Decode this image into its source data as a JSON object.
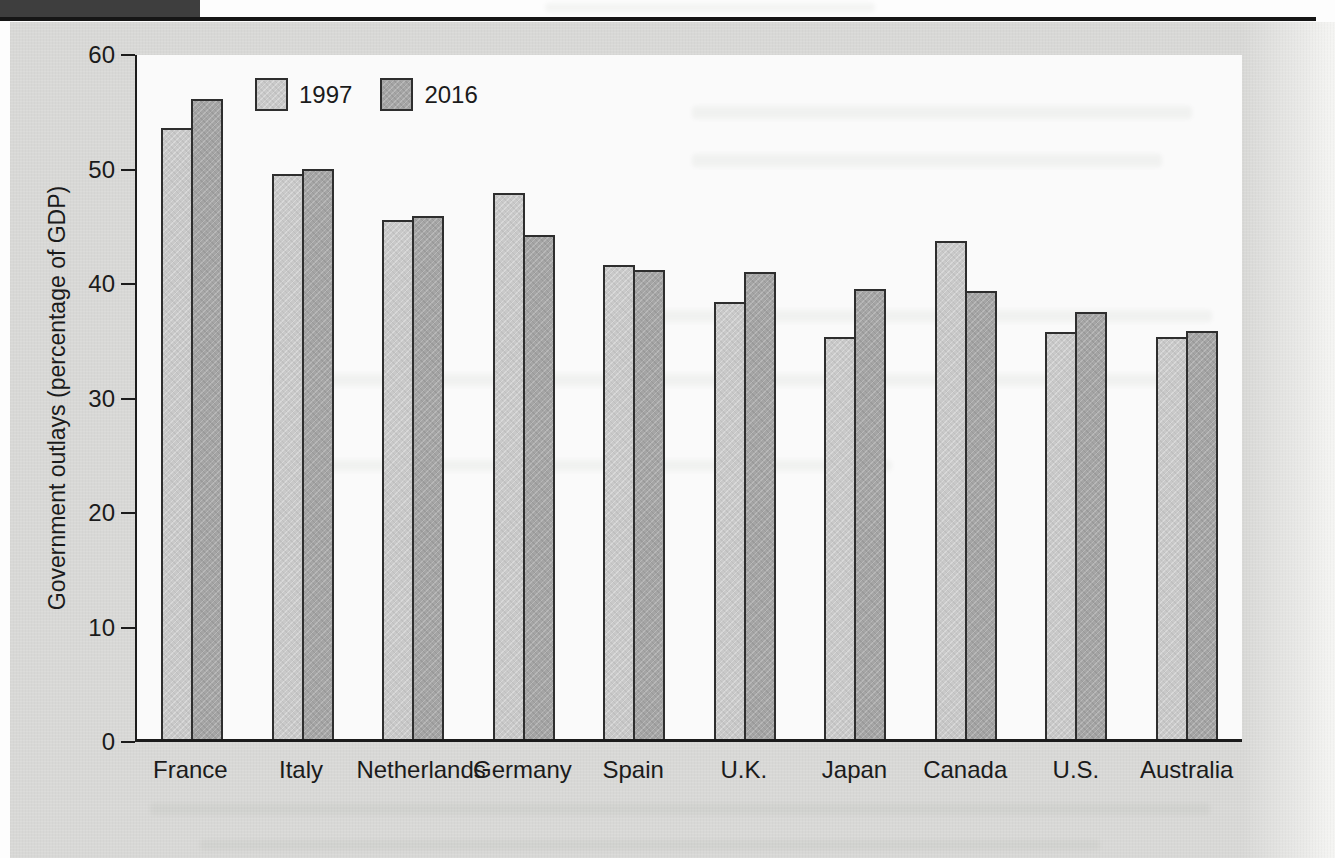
{
  "figure": {
    "header_band_color": "#3e3e3e",
    "rule_color": "#161616",
    "panel_background": "#d8d8d6",
    "plot_background": "#fafafa",
    "axis_color": "#1c1c1c",
    "bar_border_color": "#2e2e2e"
  },
  "chart_data": {
    "type": "bar",
    "ylabel": "Government outlays (percentage of GDP)",
    "ylim": [
      0,
      60
    ],
    "yticks": [
      0,
      10,
      20,
      30,
      40,
      50,
      60
    ],
    "grid": false,
    "legend": {
      "position": "inside-top-left",
      "entries": [
        "1997",
        "2016"
      ]
    },
    "categories": [
      "France",
      "Italy",
      "Netherlands",
      "Germany",
      "Spain",
      "U.K.",
      "Japan",
      "Canada",
      "U.S.",
      "Australia"
    ],
    "series": [
      {
        "name": "1997",
        "color": "#c9c9c9",
        "values": [
          53.6,
          49.6,
          45.5,
          47.9,
          41.6,
          38.3,
          35.3,
          43.7,
          35.7,
          35.3
        ]
      },
      {
        "name": "2016",
        "color": "#a5a5a5",
        "values": [
          56.1,
          50.0,
          45.9,
          44.2,
          41.1,
          41.0,
          39.5,
          39.3,
          37.5,
          35.8
        ]
      }
    ]
  }
}
